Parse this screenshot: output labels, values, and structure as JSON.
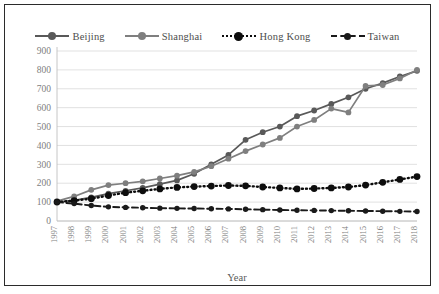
{
  "chart_data": {
    "type": "line",
    "title": "",
    "xlabel": "Year",
    "ylabel": "",
    "grid": true,
    "legend_position": "top",
    "ylim": [
      0,
      900
    ],
    "yticks": [
      0,
      100,
      200,
      300,
      400,
      500,
      600,
      700,
      800,
      900
    ],
    "x": [
      1997,
      1998,
      1999,
      2000,
      2001,
      2002,
      2003,
      2004,
      2005,
      2006,
      2007,
      2008,
      2009,
      2010,
      2011,
      2012,
      2013,
      2014,
      2015,
      2016,
      2017,
      2018
    ],
    "categories": [
      "1997",
      "1998",
      "1999",
      "2000",
      "2001",
      "2002",
      "2003",
      "2004",
      "2005",
      "2006",
      "2007",
      "2008",
      "2009",
      "2010",
      "2011",
      "2012",
      "2013",
      "2014",
      "2015",
      "2016",
      "2017",
      "2018"
    ],
    "series": [
      {
        "name": "Beijing",
        "color": "#595959",
        "style": "solid",
        "marker": "circle",
        "values": [
          100,
          110,
          125,
          145,
          160,
          175,
          195,
          215,
          250,
          300,
          350,
          430,
          470,
          500,
          555,
          585,
          620,
          655,
          700,
          730,
          765,
          795
        ]
      },
      {
        "name": "Shanghai",
        "color": "#7f7f7f",
        "style": "solid",
        "marker": "circle",
        "values": [
          105,
          130,
          165,
          190,
          200,
          210,
          225,
          240,
          260,
          290,
          330,
          370,
          405,
          440,
          500,
          535,
          595,
          575,
          715,
          720,
          755,
          800
        ]
      },
      {
        "name": "Hong Kong",
        "color": "#0d0d0d",
        "style": "dotted",
        "marker": "circle",
        "values": [
          100,
          108,
          118,
          135,
          150,
          160,
          170,
          178,
          182,
          185,
          188,
          186,
          180,
          175,
          170,
          172,
          175,
          180,
          190,
          205,
          220,
          235
        ]
      },
      {
        "name": "Taiwan",
        "color": "#1a1a1a",
        "style": "dashed",
        "marker": "circle",
        "values": [
          100,
          92,
          82,
          75,
          72,
          70,
          68,
          67,
          66,
          65,
          64,
          62,
          60,
          58,
          57,
          56,
          55,
          54,
          53,
          52,
          51,
          50
        ]
      }
    ]
  },
  "legend": {
    "items": [
      {
        "label": "Beijing"
      },
      {
        "label": "Shanghai"
      },
      {
        "label": "Hong Kong"
      },
      {
        "label": "Taiwan"
      }
    ]
  },
  "axis": {
    "x_title": "Year"
  }
}
